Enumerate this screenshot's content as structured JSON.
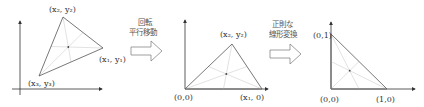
{
  "panels": [
    {
      "name": "original-triangle",
      "vertices": [
        {
          "label": "(x₁, y₁)",
          "id": "v1"
        },
        {
          "label": "(x₂, y₂)",
          "id": "v2"
        },
        {
          "label": "(x₃, y₃)",
          "id": "v3"
        }
      ]
    },
    {
      "name": "rotated-translated-triangle",
      "vertices": [
        {
          "label": "(0,0)",
          "id": "origin"
        },
        {
          "label": "(x₁, 0)",
          "id": "v1"
        },
        {
          "label": "(x₂, y₂)",
          "id": "v2"
        }
      ]
    },
    {
      "name": "normalized-triangle",
      "vertices": [
        {
          "label": "(0,0)",
          "id": "origin"
        },
        {
          "label": "(1,0)",
          "id": "v1"
        },
        {
          "label": "(0,1)",
          "id": "v2"
        }
      ]
    }
  ],
  "arrows": [
    {
      "line1": "回転",
      "line2": "平行移動"
    },
    {
      "line1": "正則な",
      "line2": "線形変換"
    }
  ],
  "colors": {
    "axis": "#333333",
    "triangle": "#555555",
    "median": "#c8c8c8",
    "arrow": "#666666"
  }
}
